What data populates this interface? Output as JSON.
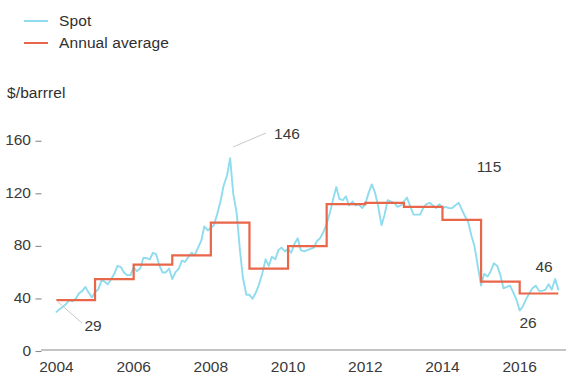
{
  "legend": {
    "items": [
      {
        "label": "Spot",
        "color": "#8fdcee"
      },
      {
        "label": "Annual average",
        "color": "#e8664a"
      }
    ]
  },
  "unit_caption": "$/barrrel",
  "chart_data": {
    "type": "line",
    "title": "",
    "subtitle": "",
    "xlabel": "",
    "ylabel": "$/barrrel",
    "xlim": [
      2003.6,
      2017.2
    ],
    "ylim": [
      0,
      172
    ],
    "grid": false,
    "legend_position": "top-left",
    "xticks": [
      2004,
      2006,
      2008,
      2010,
      2012,
      2014,
      2016
    ],
    "xtick_labels": [
      "2004",
      "2006",
      "2008",
      "2010",
      "2012",
      "2014",
      "2016"
    ],
    "yticks": [
      0,
      40,
      80,
      120,
      160
    ],
    "ytick_labels": [
      "0",
      "40",
      "80",
      "120",
      "160"
    ],
    "annotations": [
      {
        "label": "29",
        "value": 29,
        "x": 93,
        "y": 331,
        "leader": [
          82,
          323,
          58,
          302
        ]
      },
      {
        "label": "146",
        "value": 146,
        "x": 287,
        "y": 139,
        "leader": [
          266,
          133,
          233,
          147
        ]
      },
      {
        "label": "115",
        "value": 115,
        "x": 489,
        "y": 172,
        "leader": null
      },
      {
        "label": "46",
        "value": 46,
        "x": 544,
        "y": 272,
        "leader": null
      },
      {
        "label": "26",
        "value": 26,
        "x": 528,
        "y": 328,
        "leader": null
      }
    ],
    "series": [
      {
        "name": "Annual average",
        "color": "#e8664a",
        "type": "step",
        "x": [
          2004,
          2005,
          2006,
          2007,
          2008,
          2009,
          2010,
          2011,
          2012,
          2013,
          2014,
          2015,
          2016
        ],
        "values": [
          38,
          54,
          65,
          72,
          97,
          62,
          79,
          111,
          112,
          109,
          99,
          52,
          43
        ]
      },
      {
        "name": "Spot",
        "color": "#8fdcee",
        "type": "line",
        "x": [
          2004.0,
          2004.08,
          2004.17,
          2004.25,
          2004.33,
          2004.42,
          2004.5,
          2004.58,
          2004.67,
          2004.75,
          2004.83,
          2004.92,
          2005.0,
          2005.08,
          2005.17,
          2005.25,
          2005.33,
          2005.42,
          2005.5,
          2005.58,
          2005.67,
          2005.75,
          2005.83,
          2005.92,
          2006.0,
          2006.08,
          2006.17,
          2006.25,
          2006.33,
          2006.42,
          2006.5,
          2006.58,
          2006.67,
          2006.75,
          2006.83,
          2006.92,
          2007.0,
          2007.08,
          2007.17,
          2007.25,
          2007.33,
          2007.42,
          2007.5,
          2007.58,
          2007.67,
          2007.75,
          2007.83,
          2007.92,
          2008.0,
          2008.08,
          2008.17,
          2008.25,
          2008.33,
          2008.42,
          2008.5,
          2008.58,
          2008.67,
          2008.75,
          2008.83,
          2008.92,
          2009.0,
          2009.08,
          2009.17,
          2009.25,
          2009.33,
          2009.42,
          2009.5,
          2009.58,
          2009.67,
          2009.75,
          2009.83,
          2009.92,
          2010.0,
          2010.08,
          2010.17,
          2010.25,
          2010.33,
          2010.42,
          2010.5,
          2010.58,
          2010.67,
          2010.75,
          2010.83,
          2010.92,
          2011.0,
          2011.08,
          2011.17,
          2011.25,
          2011.33,
          2011.42,
          2011.5,
          2011.58,
          2011.67,
          2011.75,
          2011.83,
          2011.92,
          2012.0,
          2012.08,
          2012.17,
          2012.25,
          2012.33,
          2012.42,
          2012.5,
          2012.58,
          2012.67,
          2012.75,
          2012.83,
          2012.92,
          2013.0,
          2013.08,
          2013.17,
          2013.25,
          2013.33,
          2013.42,
          2013.5,
          2013.58,
          2013.67,
          2013.75,
          2013.83,
          2013.92,
          2014.0,
          2014.08,
          2014.17,
          2014.25,
          2014.33,
          2014.42,
          2014.5,
          2014.58,
          2014.67,
          2014.75,
          2014.83,
          2014.92,
          2015.0,
          2015.08,
          2015.17,
          2015.25,
          2015.33,
          2015.42,
          2015.5,
          2015.58,
          2015.67,
          2015.75,
          2015.83,
          2015.92,
          2016.0,
          2016.08,
          2016.17,
          2016.25,
          2016.33,
          2016.42,
          2016.5,
          2016.58,
          2016.67,
          2016.75,
          2016.83,
          2016.92,
          2017.0
        ],
        "values": [
          29,
          31,
          33,
          35,
          38,
          37,
          39,
          43,
          45,
          48,
          44,
          40,
          44,
          46,
          53,
          52,
          50,
          54,
          58,
          64,
          63,
          59,
          57,
          57,
          63,
          60,
          62,
          70,
          70,
          69,
          74,
          73,
          64,
          59,
          59,
          62,
          54,
          59,
          62,
          68,
          67,
          71,
          74,
          72,
          78,
          83,
          94,
          91,
          93,
          95,
          104,
          113,
          125,
          133,
          146,
          119,
          104,
          77,
          55,
          42,
          42,
          39,
          44,
          50,
          58,
          69,
          64,
          71,
          69,
          76,
          78,
          75,
          77,
          74,
          81,
          85,
          76,
          75,
          76,
          77,
          78,
          83,
          85,
          90,
          96,
          104,
          115,
          124,
          115,
          114,
          117,
          110,
          113,
          110,
          111,
          108,
          111,
          119,
          126,
          120,
          110,
          95,
          103,
          114,
          113,
          112,
          109,
          110,
          113,
          116,
          109,
          103,
          103,
          103,
          108,
          111,
          112,
          110,
          108,
          111,
          108,
          109,
          108,
          108,
          110,
          112,
          107,
          102,
          97,
          87,
          79,
          63,
          49,
          58,
          56,
          60,
          66,
          64,
          57,
          47,
          48,
          49,
          44,
          38,
          30,
          33,
          39,
          43,
          47,
          49,
          45,
          45,
          46,
          50,
          46,
          54,
          46
        ]
      }
    ]
  }
}
